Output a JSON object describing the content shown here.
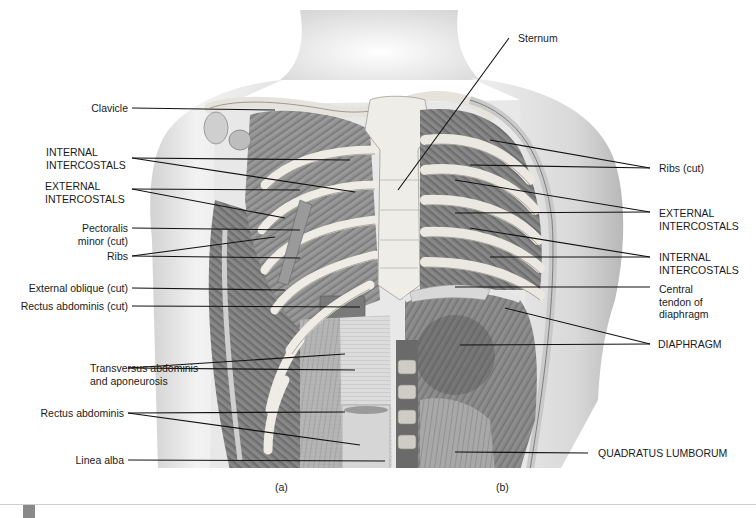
{
  "figure": {
    "panels": [
      {
        "id": "a",
        "label": "(a)"
      },
      {
        "id": "b",
        "label": "(b)"
      }
    ],
    "labels_left": {
      "clavicle": "Clavicle",
      "internal_intercostals_1": "INTERNAL",
      "internal_intercostals_2": "INTERCOSTALS",
      "external_intercostals_1": "EXTERNAL",
      "external_intercostals_2": "INTERCOSTALS",
      "pectoralis_1": "Pectoralis",
      "pectoralis_2": "minor (cut)",
      "ribs": "Ribs",
      "external_oblique": "External oblique (cut)",
      "rectus_cut": "Rectus abdominis (cut)",
      "transversus_1": "Transversus abdominis",
      "transversus_2": "and aponeurosis",
      "rectus": "Rectus abdominis",
      "linea_alba": "Linea alba"
    },
    "labels_right": {
      "sternum": "Sternum",
      "ribs_cut": "Ribs (cut)",
      "external_intercostals_1": "EXTERNAL",
      "external_intercostals_2": "INTERCOSTALS",
      "internal_intercostals_1": "INTERNAL",
      "internal_intercostals_2": "INTERCOSTALS",
      "central_tendon_1": "Central",
      "central_tendon_2": "tendon of",
      "central_tendon_3": "diaphragm",
      "diaphragm": "DIAPHRAGM",
      "quadratus": "QUADRATUS LUMBORUM"
    },
    "colors": {
      "skin": "#e6e6e6",
      "skin_shadow": "#bdbdbd",
      "bone": "#e9e7e2",
      "muscle": "#8d8d8d",
      "muscle_dark": "#5a5a5a",
      "leader": "#111111"
    }
  }
}
